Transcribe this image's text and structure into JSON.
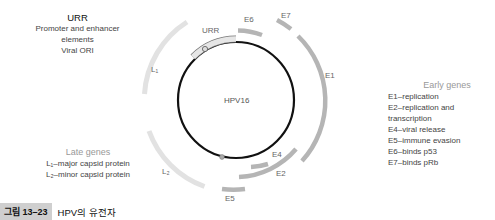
{
  "urr_info": {
    "title": "URR",
    "lines": [
      "Promoter and enhancer",
      "elements",
      "Viral ORI"
    ]
  },
  "early_genes": {
    "title": "Early genes",
    "items": [
      "E1–replication",
      "E2–replication and transcription",
      "E4–viral release",
      "E5–immune evasion",
      "E6–binds p53",
      "E7–binds pRb"
    ]
  },
  "late_genes": {
    "title": "Late genes",
    "items": [
      "L₁–major capsid protein",
      "L₂–minor capsid protein"
    ]
  },
  "diagram": {
    "center_label": "HPV16",
    "region_labels": {
      "urr": "URR",
      "e6": "E6",
      "e7": "E7",
      "e1": "E1",
      "e4": "E4",
      "e2": "E2",
      "e5": "E5",
      "l1": "L₁",
      "l2": "L₂"
    },
    "colors": {
      "genome": "#111111",
      "early_arc": "#b5b5b5",
      "late_arc": "#e2e2e2",
      "urr_box": "#e6e6e6"
    }
  },
  "caption": {
    "figure_number": "그림 13–23",
    "text": "HPV의 유전자"
  }
}
